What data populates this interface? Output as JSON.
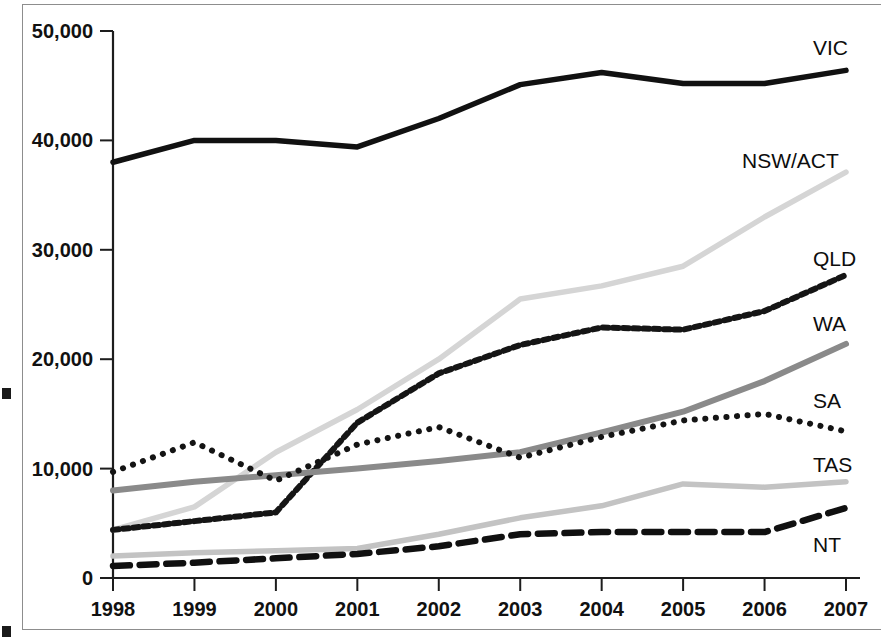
{
  "chart_data": {
    "type": "line",
    "title": "",
    "subtitle": "",
    "xlabel": "",
    "ylabel": "",
    "x": [
      1998,
      1999,
      2000,
      2001,
      2002,
      2003,
      2004,
      2005,
      2006,
      2007
    ],
    "tick_labels_x": [
      "1998",
      "1999",
      "2000",
      "2001",
      "2002",
      "2003",
      "2004",
      "2005",
      "2006",
      "2007"
    ],
    "tick_labels_y": [
      "0",
      "10,000",
      "20,000",
      "30,000",
      "40,000",
      "50,000"
    ],
    "tick_values_y": [
      0,
      10000,
      20000,
      30000,
      40000,
      50000
    ],
    "ylim": [
      0,
      50000
    ],
    "xlim": [
      1998,
      2007
    ],
    "grid": false,
    "legend_position": "inline-right",
    "series": [
      {
        "name": "VIC",
        "values": [
          38000,
          40000,
          40000,
          39400,
          42000,
          45100,
          46200,
          45200,
          45200,
          46400
        ],
        "color": "#111111",
        "width": 5.5,
        "dash": "none",
        "label_x": 813,
        "label_y": 55
      },
      {
        "name": "NSW/ACT",
        "values": [
          4400,
          6500,
          11500,
          15400,
          20000,
          25500,
          26700,
          28500,
          33000,
          37100
        ],
        "color": "#d5d5d5",
        "width": 5.5,
        "dash": "none",
        "label_x": 742,
        "label_y": 168
      },
      {
        "name": "QLD",
        "values": [
          4400,
          5200,
          6000,
          14200,
          18700,
          21300,
          22900,
          22700,
          24400,
          27700
        ],
        "color": "#151515",
        "width": 6,
        "dash": "square",
        "label_x": 813,
        "label_y": 266
      },
      {
        "name": "WA",
        "values": [
          8000,
          8800,
          9400,
          10000,
          10700,
          11500,
          13300,
          15200,
          18000,
          21400
        ],
        "color": "#8a8a8a",
        "width": 6,
        "dash": "none",
        "label_x": 813,
        "label_y": 331
      },
      {
        "name": "SA",
        "values": [
          9700,
          12400,
          8900,
          12200,
          13800,
          11000,
          12900,
          14400,
          15000,
          13400
        ],
        "color": "#141414",
        "width": 6,
        "dash": "dot",
        "label_x": 813,
        "label_y": 408
      },
      {
        "name": "TAS",
        "values": [
          2000,
          2300,
          2500,
          2700,
          4000,
          5500,
          6600,
          8600,
          8300,
          8800
        ],
        "color": "#c3c3c3",
        "width": 5.5,
        "dash": "none",
        "label_x": 813,
        "label_y": 472
      },
      {
        "name": "NT",
        "values": [
          1100,
          1400,
          1800,
          2200,
          2900,
          4000,
          4200,
          4200,
          4200,
          6400
        ],
        "color": "#101010",
        "width": 6.5,
        "dash": "dash",
        "label_x": 813,
        "label_y": 552
      }
    ]
  },
  "figure": {
    "edge_caption": ""
  }
}
